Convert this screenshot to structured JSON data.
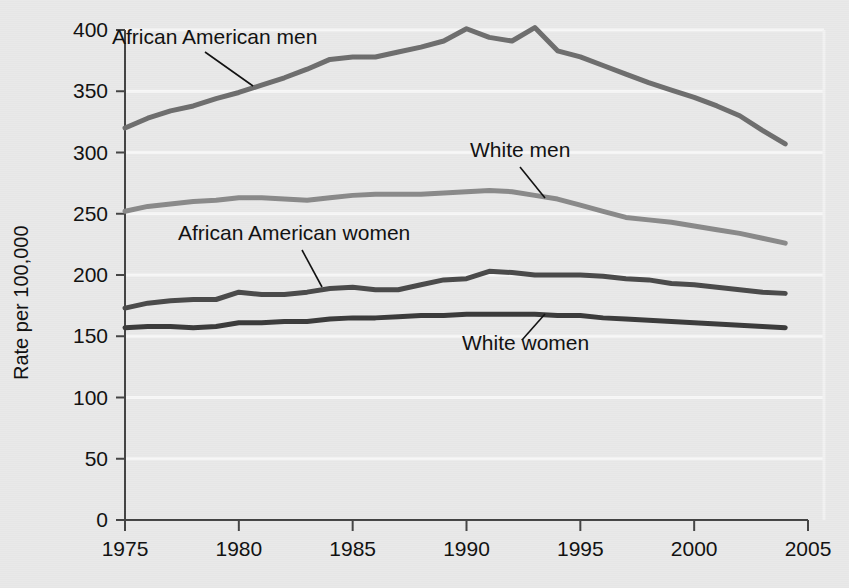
{
  "chart_data": {
    "type": "line",
    "title": "",
    "subtitle": "",
    "xlabel": "",
    "ylabel": "Rate per 100,000",
    "xlim": [
      1975,
      2005
    ],
    "ylim": [
      0,
      400
    ],
    "ytick_step": 50,
    "xtick_step": 5,
    "grid": "horizontal-white",
    "legend_position": "inline-annotations",
    "background_color": "#e9e9e9",
    "plot_background_color": "#e9e9e9",
    "gridline_color": "#f7f7f7",
    "axis_color": "#444444",
    "x_tick_labels": [
      "1975",
      "1980",
      "1985",
      "1990",
      "1995",
      "2000",
      "2005"
    ],
    "y_tick_labels": [
      "0",
      "50",
      "100",
      "150",
      "200",
      "250",
      "300",
      "350",
      "400"
    ],
    "x": [
      1975,
      1976,
      1977,
      1978,
      1979,
      1980,
      1981,
      1982,
      1983,
      1984,
      1985,
      1986,
      1987,
      1988,
      1989,
      1990,
      1991,
      1992,
      1993,
      1994,
      1995,
      1996,
      1997,
      1998,
      1999,
      2000,
      2001,
      2002,
      2003,
      2004
    ],
    "series": [
      {
        "name": "African American men",
        "color": "#6e6e6e",
        "line_width": 5,
        "label": "African American men",
        "label_x": 112,
        "label_y": 44,
        "leader_from_x": 205,
        "leader_from_y": 52,
        "leader_to_x": 253,
        "leader_to_y": 86,
        "values": [
          320,
          328,
          334,
          338,
          344,
          349,
          355,
          361,
          368,
          376,
          378,
          378,
          382,
          386,
          391,
          401,
          394,
          391,
          402,
          383,
          378,
          371,
          364,
          357,
          351,
          345,
          338,
          330,
          318,
          307
        ]
      },
      {
        "name": "White men",
        "color": "#8a8a8a",
        "line_width": 5,
        "label": "White men",
        "label_x": 470,
        "label_y": 157,
        "leader_from_x": 520,
        "leader_from_y": 167,
        "leader_to_x": 545,
        "leader_to_y": 198,
        "values": [
          252,
          256,
          258,
          260,
          261,
          263,
          263,
          262,
          261,
          263,
          265,
          266,
          266,
          266,
          267,
          268,
          269,
          268,
          265,
          262,
          257,
          252,
          247,
          245,
          243,
          240,
          237,
          234,
          230,
          226
        ]
      },
      {
        "name": "African American women",
        "color": "#4a4a4a",
        "line_width": 5,
        "label": "African American women",
        "label_x": 178,
        "label_y": 240,
        "leader_from_x": 302,
        "leader_from_y": 250,
        "leader_to_x": 322,
        "leader_to_y": 287,
        "values": [
          173,
          177,
          179,
          180,
          180,
          186,
          184,
          184,
          186,
          189,
          190,
          188,
          188,
          192,
          196,
          197,
          203,
          202,
          200,
          200,
          200,
          199,
          197,
          196,
          193,
          192,
          190,
          188,
          186,
          185
        ]
      },
      {
        "name": "White women",
        "color": "#3b3b3b",
        "line_width": 5,
        "label": "White women",
        "label_x": 462,
        "label_y": 350,
        "leader_from_x": 522,
        "leader_from_y": 340,
        "leader_to_x": 545,
        "leader_to_y": 314,
        "values": [
          157,
          158,
          158,
          157,
          158,
          161,
          161,
          162,
          162,
          164,
          165,
          165,
          166,
          167,
          167,
          168,
          168,
          168,
          168,
          167,
          167,
          165,
          164,
          163,
          162,
          161,
          160,
          159,
          158,
          157
        ]
      }
    ]
  }
}
